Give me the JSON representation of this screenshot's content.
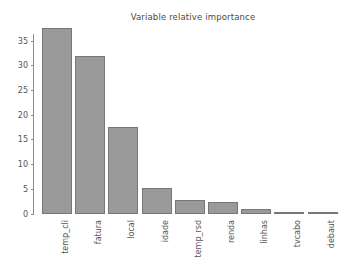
{
  "chart_data": {
    "type": "bar",
    "title": "Variable relative importance",
    "xlabel": "",
    "ylabel": "",
    "categories": [
      "temp_cli",
      "fatura",
      "local",
      "idade",
      "temp_rsd",
      "renda",
      "linhas",
      "tvcabo",
      "debaut"
    ],
    "values": [
      37.6,
      32.0,
      17.6,
      5.3,
      2.9,
      2.5,
      1.1,
      0.5,
      0.05
    ],
    "ylim": [
      0,
      38.5
    ],
    "yticks": [
      0,
      5,
      10,
      15,
      20,
      25,
      30,
      35
    ],
    "ytick_labels": [
      "0",
      "5",
      "10",
      "15",
      "20",
      "25",
      "30",
      "35"
    ],
    "grid": false,
    "legend": false,
    "bar_color": "#9a9a9a",
    "bar_edge_color": "#777777",
    "background_color": "#ffffff",
    "axis_color": "#8c8c8c",
    "text_color": "#555555",
    "xtick_rotation": 90
  }
}
